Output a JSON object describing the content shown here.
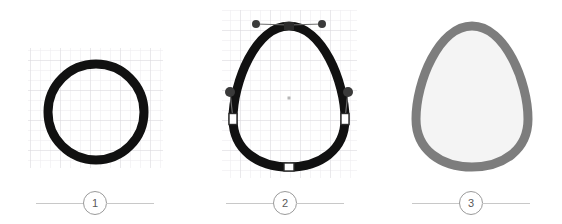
{
  "illustration": {
    "title": "Egg shape construction steps",
    "background_color": "#ffffff",
    "steps": [
      {
        "number": "1",
        "name": "circle-on-grid",
        "description": "Black circle outline drawn on a light grid",
        "shape": "circle",
        "stroke_color": "#111111",
        "stroke_width": 9,
        "fill_color": "none",
        "grid": {
          "visible": true,
          "minor_color": "#eceaee",
          "major_color": "#dcdade",
          "minor_spacing": 10,
          "major_spacing": 30,
          "x": 28,
          "y": 48,
          "width": 135,
          "height": 120
        },
        "geometry": {
          "center_x": 96,
          "center_y": 112,
          "radius": 48
        }
      },
      {
        "number": "2",
        "name": "egg-with-vector-nodes",
        "description": "Circle reshaped into an egg outline with bezier anchor points and control handles",
        "shape": "egg-path",
        "stroke_color": "#111111",
        "stroke_width": 9,
        "fill_color": "none",
        "grid": {
          "visible": true,
          "minor_color": "#eceaee",
          "major_color": "#dcdade",
          "minor_spacing": 10,
          "major_spacing": 30,
          "x": 222,
          "y": 10,
          "width": 135,
          "height": 168
        },
        "center_marker": {
          "x": 289,
          "y": 98,
          "color": "#b6b6b6",
          "size": 3
        },
        "anchors": [
          {
            "name": "anchor-top",
            "x": 289,
            "y": 26,
            "state": "selected",
            "fill": "#2b2b2b",
            "stroke": "#2b2b2b",
            "width": 9,
            "height": 7
          },
          {
            "name": "anchor-left",
            "x": 233,
            "y": 119,
            "state": "normal",
            "fill": "#ffffff",
            "stroke": "#2b2b2b",
            "width": 8,
            "height": 11
          },
          {
            "name": "anchor-right",
            "x": 345,
            "y": 119,
            "state": "normal",
            "fill": "#ffffff",
            "stroke": "#2b2b2b",
            "width": 8,
            "height": 11
          },
          {
            "name": "anchor-bottom",
            "x": 289,
            "y": 167,
            "state": "normal",
            "fill": "#ffffff",
            "stroke": "#2b2b2b",
            "width": 10,
            "height": 8
          }
        ],
        "handles": [
          {
            "name": "handle-top-left",
            "anchor_x": 289,
            "anchor_y": 26,
            "x": 256,
            "y": 24,
            "radius": 4,
            "color": "#3a3a3a",
            "line_color": "#6d6d6d"
          },
          {
            "name": "handle-top-right",
            "anchor_x": 289,
            "anchor_y": 26,
            "x": 322,
            "y": 24,
            "radius": 4,
            "color": "#3a3a3a",
            "line_color": "#6d6d6d"
          },
          {
            "name": "handle-left",
            "anchor_x": 233,
            "anchor_y": 119,
            "x": 230,
            "y": 92,
            "radius": 5,
            "color": "#3a3a3a",
            "line_color": "#6d6d6d"
          },
          {
            "name": "handle-right",
            "anchor_x": 345,
            "anchor_y": 119,
            "x": 348,
            "y": 92,
            "radius": 5,
            "color": "#3a3a3a",
            "line_color": "#6d6d6d"
          }
        ]
      },
      {
        "number": "3",
        "name": "finished-egg",
        "description": "Completed egg shape with gray outline and off-white fill",
        "shape": "egg-path",
        "stroke_color": "#7d7d7d",
        "stroke_width": 9,
        "fill_color": "#f4f4f4",
        "grid": {
          "visible": false
        }
      }
    ]
  }
}
